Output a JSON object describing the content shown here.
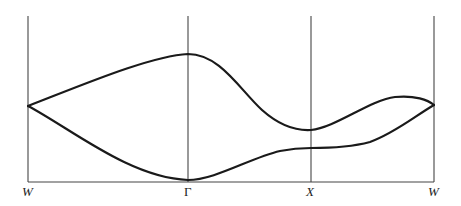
{
  "diagram": {
    "type": "band-structure-dispersion",
    "high_symmetry_points": [
      {
        "label": "W",
        "x": 28
      },
      {
        "label": "Γ",
        "x": 188
      },
      {
        "label": "X",
        "x": 311
      },
      {
        "label": "W",
        "x": 434
      }
    ],
    "branches": [
      {
        "name": "upper-branch",
        "description": "From W junction rises to maximum at Γ, falls to minimum at X, rises to local max before W, meets at W"
      },
      {
        "name": "lower-branch",
        "description": "From W junction falls to minimum at Γ, rises to plateau at X, rises to meet at W"
      }
    ],
    "colors": {
      "curve": "#1a1a1a",
      "axis": "#555555",
      "background": "#ffffff"
    }
  }
}
